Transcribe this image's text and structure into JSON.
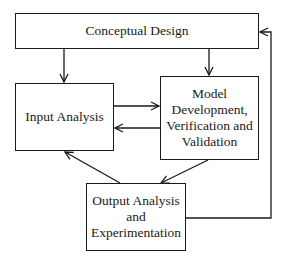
{
  "diagram": {
    "type": "flowchart",
    "nodes": [
      {
        "id": "concept",
        "label_lines": [
          "Conceptual Design"
        ]
      },
      {
        "id": "input",
        "label_lines": [
          "Input Analysis"
        ]
      },
      {
        "id": "model",
        "label_lines": [
          "Model",
          "Development,",
          "Verification and",
          "Validation"
        ]
      },
      {
        "id": "output",
        "label_lines": [
          "Output Analysis",
          "and",
          "Experimentation"
        ]
      }
    ],
    "edges": [
      {
        "from": "concept",
        "to": "input"
      },
      {
        "from": "concept",
        "to": "model"
      },
      {
        "from": "input",
        "to": "model"
      },
      {
        "from": "model",
        "to": "input"
      },
      {
        "from": "model",
        "to": "output"
      },
      {
        "from": "output",
        "to": "input"
      },
      {
        "from": "output",
        "to": "concept"
      }
    ]
  },
  "colors": {
    "line": "#1a1a1a",
    "background": "#ffffff"
  }
}
